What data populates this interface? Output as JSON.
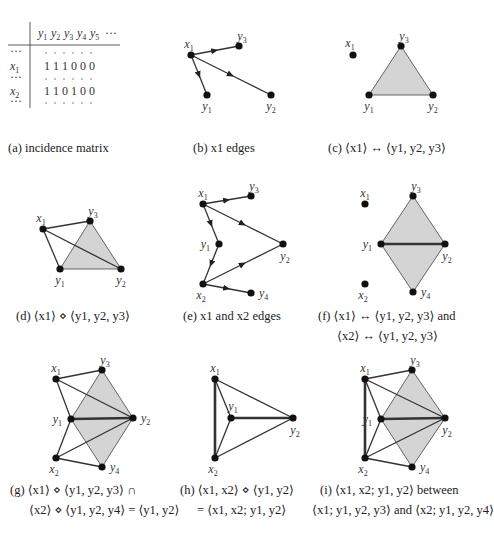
{
  "figure": {
    "panels": [
      {
        "id": "a",
        "caption": "(a) incidence matrix",
        "matrix": {
          "column_headers": [
            "y1",
            "y2",
            "y3",
            "y4",
            "y5",
            "…"
          ],
          "row_headers": [
            "…",
            "x1",
            "…",
            "x2",
            "…"
          ],
          "rows": {
            "x1": [
              1,
              1,
              1,
              0,
              0,
              0
            ],
            "x2": [
              1,
              1,
              0,
              1,
              0,
              0
            ]
          }
        }
      },
      {
        "id": "b",
        "caption": "(b) x1 edges",
        "nodes": {
          "x1": [
            191,
            55
          ],
          "y3": [
            239,
            46
          ],
          "y1": [
            207,
            95
          ],
          "y2": [
            271,
            95
          ]
        },
        "directed_edges": [
          [
            "x1",
            "y3"
          ],
          [
            "x1",
            "y1"
          ],
          [
            "x1",
            "y2"
          ]
        ]
      },
      {
        "id": "c",
        "caption": "(c) ⟨x1⟩ ↔ ⟨y1, y2, y3⟩",
        "nodes": {
          "x1": [
            353,
            55
          ],
          "y3": [
            401,
            46
          ],
          "y1": [
            369,
            95
          ],
          "y2": [
            433,
            95
          ]
        },
        "triangles": [
          [
            "y1",
            "y2",
            "y3"
          ]
        ]
      },
      {
        "id": "d",
        "caption": "(d) ⟨x1⟩ ⋄ ⟨y1, y2, y3⟩",
        "nodes": {
          "x1": [
            43,
            229
          ],
          "y3": [
            90,
            221
          ],
          "y1": [
            60,
            269
          ],
          "y2": [
            121,
            269
          ]
        },
        "triangles": [
          [
            "y1",
            "y2",
            "y3"
          ]
        ],
        "edges": [
          [
            "x1",
            "y3"
          ],
          [
            "x1",
            "y1"
          ],
          [
            "x1",
            "y2"
          ]
        ]
      },
      {
        "id": "e",
        "caption": "(e) x1 and x2 edges",
        "nodes": {
          "x1": [
            203,
            204
          ],
          "y3": [
            251,
            196
          ],
          "y1": [
            219,
            244
          ],
          "y2": [
            283,
            244
          ],
          "x2": [
            203,
            284
          ],
          "y4": [
            251,
            293
          ]
        },
        "directed_edges": [
          [
            "x1",
            "y3"
          ],
          [
            "x1",
            "y1"
          ],
          [
            "x1",
            "y2"
          ],
          [
            "y1",
            "x2"
          ],
          [
            "x2",
            "y2"
          ],
          [
            "x2",
            "y4"
          ]
        ]
      },
      {
        "id": "f",
        "caption_line1": "(f) ⟨x1⟩ ↔ ⟨y1, y2, y3⟩ and",
        "caption_line2": "⟨x2⟩ ↔ ⟨y1, y2, y3⟩",
        "nodes": {
          "x1": [
            365,
            204
          ],
          "y3": [
            413,
            196
          ],
          "y1": [
            381,
            244
          ],
          "y2": [
            445,
            244
          ],
          "x2": [
            365,
            284
          ],
          "y4": [
            413,
            292
          ]
        },
        "triangles": [
          [
            "y1",
            "y2",
            "y3"
          ],
          [
            "y1",
            "y2",
            "y4"
          ]
        ],
        "thick_edges": [
          [
            "y1",
            "y2"
          ]
        ]
      },
      {
        "id": "g",
        "caption_line1": "(g) ⟨x1⟩ ⋄ ⟨y1, y2, y3⟩ ∩",
        "caption_line2": "⟨x2⟩ ⋄ ⟨y1, y2, y4⟩ = ⟨y1, y2⟩",
        "nodes": {
          "x1": [
            56,
            379
          ],
          "y3": [
            102,
            370
          ],
          "y1": [
            71,
            419
          ],
          "y2": [
            133,
            418
          ],
          "x2": [
            56,
            458
          ],
          "y4": [
            102,
            467
          ]
        },
        "triangles": [
          [
            "y1",
            "y2",
            "y3"
          ],
          [
            "y1",
            "y2",
            "y4"
          ]
        ],
        "edges": [
          [
            "x1",
            "y3"
          ],
          [
            "x1",
            "y1"
          ],
          [
            "x1",
            "y2"
          ],
          [
            "x2",
            "y1"
          ],
          [
            "x2",
            "y2"
          ],
          [
            "x2",
            "y4"
          ]
        ],
        "thick_edges": [
          [
            "y1",
            "y2"
          ]
        ]
      },
      {
        "id": "h",
        "caption_line1": "(h) ⟨x1, x2⟩ ⋄ ⟨y1, y2⟩",
        "caption_line2": "= ⟨x1, x2; y1, y2⟩",
        "nodes": {
          "x1": [
            215,
            379
          ],
          "y1": [
            231,
            418
          ],
          "y2": [
            293,
            418
          ],
          "x2": [
            215,
            458
          ]
        },
        "edges": [
          [
            "x1",
            "y1"
          ],
          [
            "x1",
            "y2"
          ],
          [
            "x2",
            "y1"
          ],
          [
            "x2",
            "y2"
          ]
        ],
        "thick_edges": [
          [
            "x1",
            "x2"
          ],
          [
            "y1",
            "y2"
          ]
        ]
      },
      {
        "id": "i",
        "caption_line1": "(i) ⟨x1, x2; y1, y2⟩ between",
        "caption_line2": "⟨x1; y1, y2, y3⟩ and ⟨x2; y1, y2, y4⟩",
        "nodes": {
          "x1": [
            365,
            379
          ],
          "y3": [
            412,
            370
          ],
          "y1": [
            381,
            419
          ],
          "y2": [
            445,
            418
          ],
          "x2": [
            365,
            458
          ],
          "y4": [
            412,
            467
          ]
        },
        "triangles": [
          [
            "y1",
            "y2",
            "y3"
          ],
          [
            "y1",
            "y2",
            "y4"
          ]
        ],
        "edges": [
          [
            "x1",
            "y3"
          ],
          [
            "x1",
            "y1"
          ],
          [
            "x1",
            "y2"
          ],
          [
            "x2",
            "y1"
          ],
          [
            "x2",
            "y2"
          ],
          [
            "x2",
            "y4"
          ]
        ],
        "thick_edges": [
          [
            "x1",
            "x2"
          ],
          [
            "y1",
            "y2"
          ]
        ]
      }
    ],
    "colors": {
      "shade": "#d4d4d4",
      "ink": "#222222"
    }
  }
}
